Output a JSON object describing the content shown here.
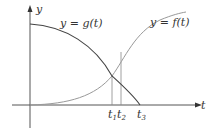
{
  "diagram": {
    "axes": {
      "x_label": "t",
      "y_label": "y"
    },
    "curves": [
      {
        "name": "g",
        "label": "y = g(t)",
        "description": "decreasing concave-down curve starting on y-axis, hitting t-axis at t3"
      },
      {
        "name": "f",
        "label": "y = f(t)",
        "description": "increasing S-shaped curve starting at origin, leveling off at top right"
      }
    ],
    "tick_labels": [
      {
        "base": "t",
        "sub": "1"
      },
      {
        "base": "t",
        "sub": "2"
      },
      {
        "base": "t",
        "sub": "3"
      }
    ],
    "colors": {
      "axis": "#555555",
      "g_curve": "#444444",
      "f_curve": "#999999",
      "guide_lines": "#888888"
    }
  }
}
